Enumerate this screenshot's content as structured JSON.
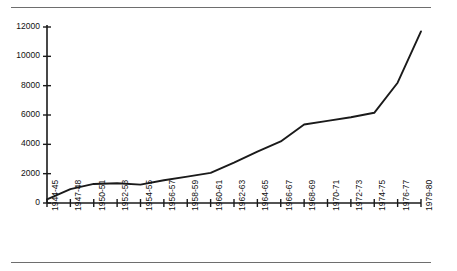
{
  "chart_data": {
    "type": "line",
    "title": "",
    "subtitle": "",
    "xlabel": "",
    "ylabel": "",
    "categories": [
      "1944-45",
      "1947-48",
      "1950-51",
      "1952-53",
      "1954-55",
      "1956-57",
      "1958-59",
      "1960-61",
      "1962-63",
      "1964-65",
      "1966-67",
      "1968-69",
      "1970-71",
      "1972-73",
      "1974-75",
      "1976-77",
      "1979-80"
    ],
    "values": [
      250,
      950,
      1300,
      1350,
      1250,
      1550,
      1800,
      2050,
      2750,
      3500,
      4200,
      5350,
      5600,
      5850,
      6150,
      8200,
      11700
    ],
    "series": [
      {
        "name": "series-1",
        "values": [
          250,
          950,
          1300,
          1350,
          1250,
          1550,
          1800,
          2050,
          2750,
          3500,
          4200,
          5350,
          5600,
          5850,
          6150,
          8200,
          11700
        ]
      }
    ],
    "ylim": [
      0,
      12000
    ],
    "yticks": [
      0,
      2000,
      4000,
      6000,
      8000,
      10000,
      12000
    ],
    "ytick_labels": [
      "0",
      "2000",
      "4000",
      "6000",
      "8000",
      "10000",
      "12000"
    ],
    "grid": false,
    "legend": false,
    "legend_position": "none",
    "line_color": "#1a1a1a",
    "axis_color": "#1a1a1a",
    "rule_color": "#6e6e6e",
    "background": "#ffffff"
  },
  "rules": {
    "top_rule_label": "top-horizontal-rule",
    "bottom_rule_label": "bottom-horizontal-rule"
  }
}
